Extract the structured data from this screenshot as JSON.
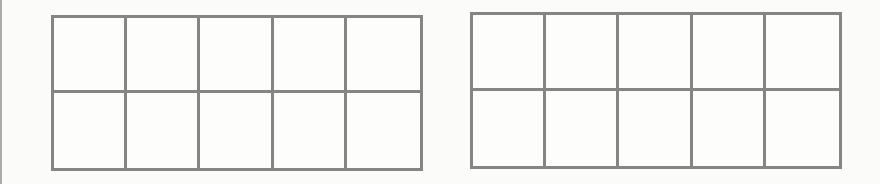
{
  "page": {
    "line_color": "#858585",
    "background_color": "#fbfbfa"
  },
  "frames": [
    {
      "id": "left",
      "rows": 2,
      "columns": 5,
      "filled_cells": 0
    },
    {
      "id": "right",
      "rows": 2,
      "columns": 5,
      "filled_cells": 0
    }
  ]
}
